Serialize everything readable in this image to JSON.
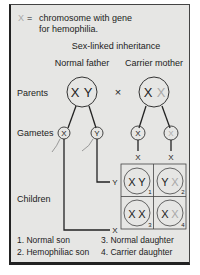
{
  "legend": {
    "symbol": "X",
    "equals": "=",
    "line1": "chromosome with gene",
    "line2": "for hemophilia."
  },
  "title": "Sex-linked inheritance",
  "parents": {
    "row_label": "Parents",
    "father_label": "Normal father",
    "mother_label": "Carrier mother",
    "father_chrom": [
      "X",
      "Y"
    ],
    "mother_chrom": [
      "X",
      "X"
    ],
    "cross_symbol": "×"
  },
  "gametes": {
    "row_label": "Gametes",
    "father": [
      "X",
      "Y"
    ],
    "mother": [
      "X",
      "X"
    ]
  },
  "punnett": {
    "col_labels": [
      "X",
      "X"
    ],
    "row_labels": [
      "Y",
      "X"
    ],
    "cells": [
      {
        "a": "X",
        "b": "Y",
        "num": "1"
      },
      {
        "a": "Y",
        "b": "X",
        "num": "2"
      },
      {
        "a": "X",
        "b": "X",
        "num": "3"
      },
      {
        "a": "X",
        "b": "X",
        "num": "4"
      }
    ]
  },
  "children": {
    "row_label": "Children",
    "key": [
      "1. Normal son",
      "2. Hemophiliac son",
      "3. Normal daughter",
      "4. Carrier daughter"
    ]
  },
  "colors": {
    "panel_bg": "#e6e6e4",
    "ink": "#222222",
    "hemophilia_x": "#a8a8a8"
  }
}
